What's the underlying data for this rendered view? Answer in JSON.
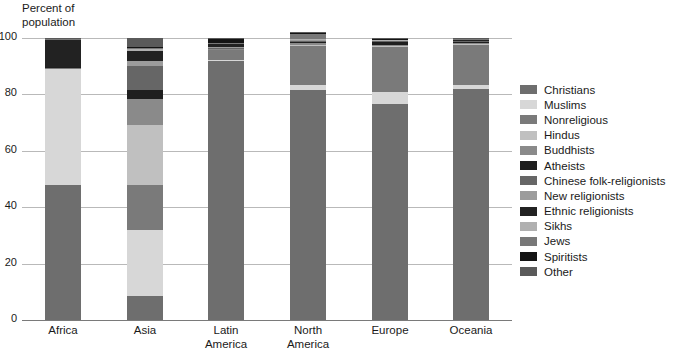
{
  "chart_data": {
    "type": "bar",
    "subtype": "stacked-percentage-column",
    "title": "",
    "ylabel": "Percent of\npopulation",
    "xlabel": "",
    "ylim": [
      0,
      100
    ],
    "yticks": [
      0,
      20,
      40,
      60,
      80,
      100
    ],
    "grid": true,
    "legend_position": "right",
    "categories": [
      "Africa",
      "Asia",
      "Latin\nAmerica",
      "North\nAmerica",
      "Europe",
      "Oceania"
    ],
    "series": [
      {
        "name": "Christians",
        "color": "#6e6e6e",
        "values": [
          48.0,
          8.5,
          92.0,
          81.5,
          76.5,
          82.0
        ]
      },
      {
        "name": "Muslims",
        "color": "#d7d7d7",
        "values": [
          41.0,
          23.5,
          0.3,
          1.8,
          4.5,
          1.2
        ]
      },
      {
        "name": "Nonreligious",
        "color": "#7a7a7a",
        "values": [
          0.4,
          16.0,
          3.5,
          14.0,
          16.0,
          14.5
        ]
      },
      {
        "name": "Hindus",
        "color": "#c0c0c0",
        "values": [
          0.2,
          21.0,
          0.2,
          0.3,
          0.2,
          0.3
        ]
      },
      {
        "name": "Buddhists",
        "color": "#8a8a8a",
        "values": [
          0.0,
          9.5,
          0.2,
          0.8,
          0.3,
          0.4
        ]
      },
      {
        "name": "Atheists",
        "color": "#1e1e1e",
        "values": [
          0.1,
          3.0,
          0.3,
          0.5,
          1.5,
          0.4
        ]
      },
      {
        "name": "Chinese folk-religionists",
        "color": "#666666",
        "values": [
          0.0,
          8.5,
          0.1,
          0.2,
          0.1,
          0.2
        ]
      },
      {
        "name": "New religionists",
        "color": "#9c9c9c",
        "values": [
          0.0,
          2.0,
          0.1,
          0.3,
          0.1,
          0.2
        ]
      },
      {
        "name": "Ethnic religionists",
        "color": "#222222",
        "values": [
          10.0,
          3.5,
          1.2,
          0.1,
          0.1,
          0.2
        ]
      },
      {
        "name": "Sikhs",
        "color": "#b0b0b0",
        "values": [
          0.0,
          0.6,
          0.0,
          0.1,
          0.1,
          0.1
        ]
      },
      {
        "name": "Jews",
        "color": "#787878",
        "values": [
          0.1,
          0.5,
          0.3,
          2.0,
          0.3,
          0.1
        ]
      },
      {
        "name": "Spiritists",
        "color": "#141414",
        "values": [
          0.0,
          0.1,
          1.3,
          0.1,
          0.1,
          0.0
        ]
      },
      {
        "name": "Other",
        "color": "#5a5a5a",
        "values": [
          0.2,
          3.3,
          0.5,
          0.3,
          0.2,
          0.4
        ]
      }
    ]
  },
  "legend": {
    "items": [
      {
        "label": "Christians"
      },
      {
        "label": "Muslims"
      },
      {
        "label": "Nonreligious"
      },
      {
        "label": "Hindus"
      },
      {
        "label": "Buddhists"
      },
      {
        "label": "Atheists"
      },
      {
        "label": "Chinese folk-religionists"
      },
      {
        "label": "New religionists"
      },
      {
        "label": "Ethnic religionists"
      },
      {
        "label": "Sikhs"
      },
      {
        "label": "Jews"
      },
      {
        "label": "Spiritists"
      },
      {
        "label": "Other"
      }
    ]
  }
}
